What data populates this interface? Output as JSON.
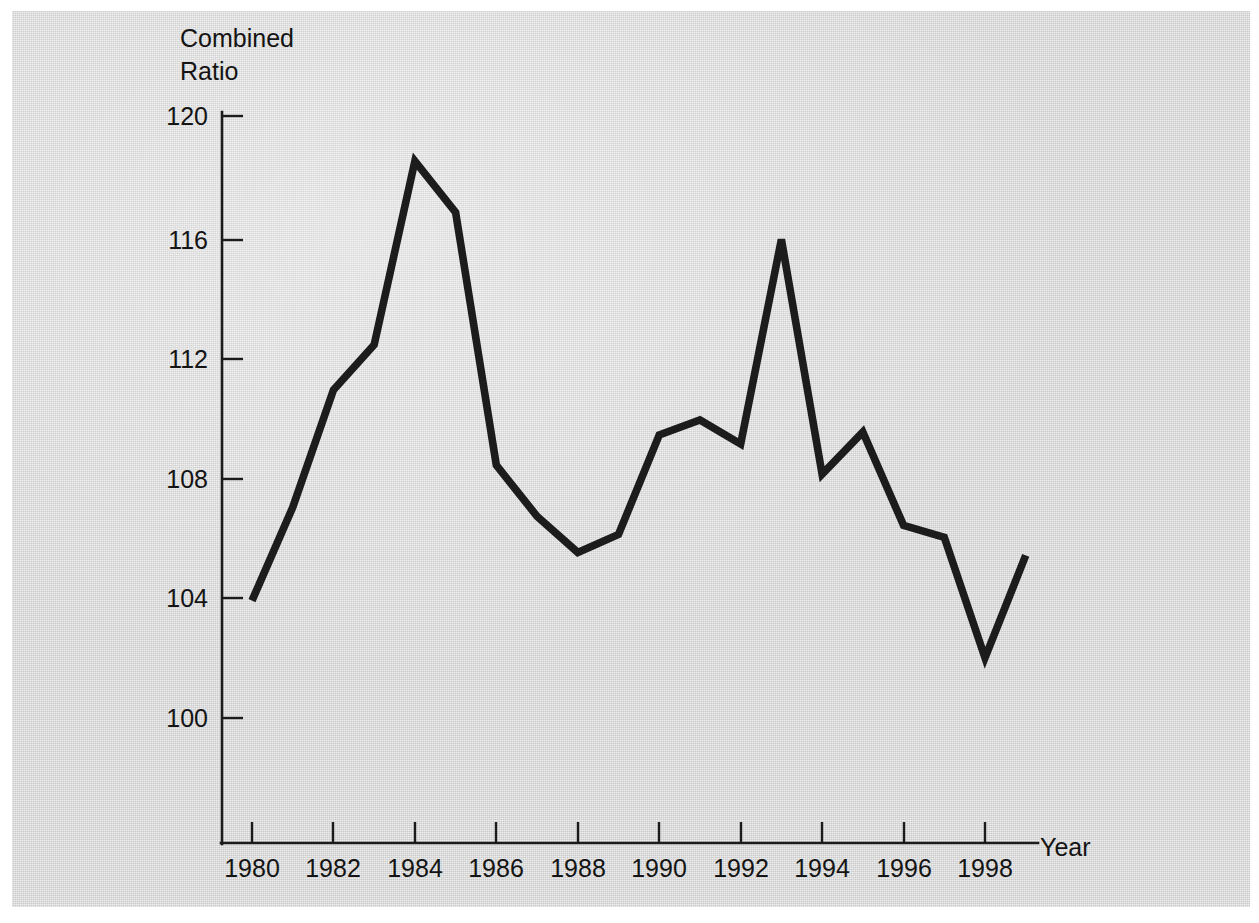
{
  "chart_data": {
    "type": "line",
    "title": "",
    "subtitle": "",
    "xlabel": "Year",
    "ylabel": "Combined Ratio",
    "ylabel_lines": [
      "Combined",
      "Ratio"
    ],
    "x": [
      1980,
      1981,
      1982,
      1983,
      1984,
      1985,
      1986,
      1987,
      1988,
      1989,
      1990,
      1991,
      1992,
      1993,
      1994,
      1995,
      1996,
      1997,
      1998,
      1999
    ],
    "values": [
      103.9,
      107.0,
      110.9,
      112.4,
      118.5,
      116.8,
      108.4,
      106.7,
      105.5,
      106.1,
      109.4,
      109.9,
      109.1,
      115.9,
      108.1,
      109.5,
      106.4,
      106.0,
      102.0,
      105.4
    ],
    "series": [
      {
        "name": "Combined Ratio",
        "color": "#1c1c1c",
        "values": [
          103.9,
          107.0,
          110.9,
          112.4,
          118.5,
          116.8,
          108.4,
          106.7,
          105.5,
          106.1,
          109.4,
          109.9,
          109.1,
          115.9,
          108.1,
          109.5,
          106.4,
          106.0,
          102.0,
          105.4
        ]
      }
    ],
    "xlim": [
      1979.25,
      1999.6
    ],
    "ylim": [
      97.5,
      120.9
    ],
    "y_ticks": [
      100,
      104,
      108,
      112,
      116,
      120
    ],
    "y_tick_labels": [
      "100",
      "104",
      "108",
      "112",
      "116",
      "120"
    ],
    "x_ticks": [
      1980,
      1982,
      1984,
      1986,
      1988,
      1990,
      1992,
      1994,
      1996,
      1998
    ],
    "x_tick_labels": [
      "1980",
      "1982",
      "1984",
      "1986",
      "1988",
      "1990",
      "1992",
      "1994",
      "1996",
      "1998"
    ],
    "grid": false,
    "legend": false,
    "legend_position": "none",
    "annotations": [],
    "background_color": "#d6d6d6",
    "line_color": "#1c1c1c",
    "axis_color": "#1b1b1b"
  },
  "figure": {
    "y_axis_title_line1": "Combined",
    "y_axis_title_line2": "Ratio",
    "x_axis_title": "Year"
  }
}
